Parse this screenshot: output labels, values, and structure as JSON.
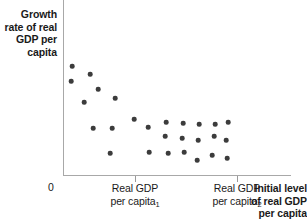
{
  "chart_data": {
    "type": "scatter",
    "title": "",
    "xlabel": "Initial level of real GDP per capita",
    "ylabel": "Growth rate of real GDP per capita",
    "origin_label": "0",
    "xtick_labels": [
      "Real GDP per capita",
      "Real GDP per capita"
    ],
    "xtick_subscripts": [
      "1",
      "2"
    ],
    "xtick_label_lines": [
      [
        "Real GDP",
        "per capita"
      ],
      [
        "Real GDP",
        "per capita"
      ]
    ],
    "xlim": [
      0,
      100
    ],
    "ylim": [
      0,
      100
    ],
    "grid": false,
    "legend": false,
    "annotations": [],
    "series_name": "countries",
    "marker_color": "#3c3c3c",
    "axis_color": "#a8a8a8",
    "relationship": "negative (convergence): growth rate declines as initial real GDP per capita rises",
    "points": [
      {
        "x": 72,
        "y": 66
      },
      {
        "x": 71,
        "y": 81
      },
      {
        "x": 90,
        "y": 74
      },
      {
        "x": 98,
        "y": 89
      },
      {
        "x": 84,
        "y": 102
      },
      {
        "x": 115,
        "y": 98
      },
      {
        "x": 93,
        "y": 128
      },
      {
        "x": 134,
        "y": 119
      },
      {
        "x": 112,
        "y": 128
      },
      {
        "x": 110,
        "y": 153
      },
      {
        "x": 148,
        "y": 127
      },
      {
        "x": 149,
        "y": 152
      },
      {
        "x": 166,
        "y": 122
      },
      {
        "x": 165,
        "y": 136
      },
      {
        "x": 168,
        "y": 153
      },
      {
        "x": 183,
        "y": 123
      },
      {
        "x": 182,
        "y": 138
      },
      {
        "x": 184,
        "y": 152
      },
      {
        "x": 199,
        "y": 124
      },
      {
        "x": 198,
        "y": 140
      },
      {
        "x": 197,
        "y": 160
      },
      {
        "x": 215,
        "y": 124
      },
      {
        "x": 214,
        "y": 136
      },
      {
        "x": 212,
        "y": 155
      },
      {
        "x": 228,
        "y": 122
      },
      {
        "x": 226,
        "y": 140
      },
      {
        "x": 227,
        "y": 158
      }
    ],
    "ticks_px": [
      135,
      237
    ],
    "plot_box_px": {
      "left": 63,
      "top": 0,
      "right": 291,
      "bottom": 175
    }
  }
}
